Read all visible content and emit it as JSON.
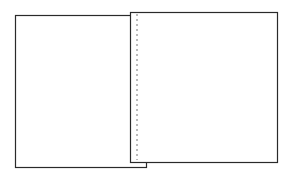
{
  "diagram": {
    "stroke_color": "#2a2a2a",
    "dash_color": "#777777",
    "background": "#ffffff",
    "shapes": [
      {
        "id": "left-sheet",
        "type": "rect",
        "x": 15,
        "y": 15,
        "width": 131,
        "height": 152
      },
      {
        "id": "right-sheet",
        "type": "rect",
        "x": 130,
        "y": 12,
        "width": 147,
        "height": 150
      },
      {
        "id": "fold-line",
        "type": "dashed-line",
        "x1": 137,
        "y1": 14,
        "x2": 137,
        "y2": 160
      }
    ]
  }
}
